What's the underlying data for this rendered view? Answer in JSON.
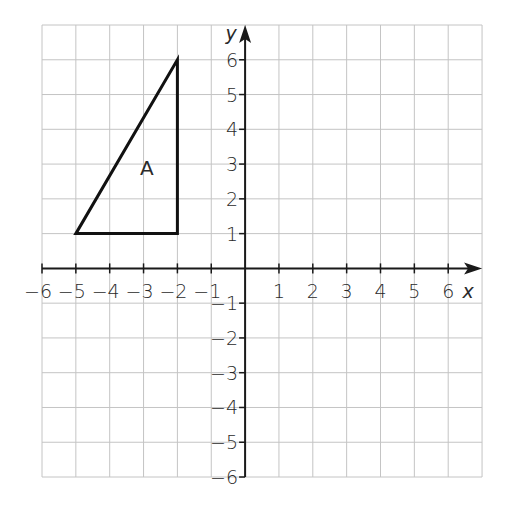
{
  "diagram": {
    "type": "coordinate-grid",
    "x_axis": {
      "label": "x",
      "min": -6,
      "max": 7,
      "tick_labels": [
        "-6",
        "-5",
        "-4",
        "-3",
        "-2",
        "-1",
        "1",
        "2",
        "3",
        "4",
        "5",
        "6"
      ]
    },
    "y_axis": {
      "label": "y",
      "min": -6,
      "max": 7,
      "tick_labels": [
        "6",
        "5",
        "4",
        "3",
        "2",
        "1",
        "-1",
        "-2",
        "-3",
        "-4",
        "-5",
        "-6"
      ]
    },
    "shapes": [
      {
        "name": "A",
        "label": "A",
        "type": "triangle",
        "vertices": [
          [
            -5,
            1
          ],
          [
            -2,
            1
          ],
          [
            -2,
            6
          ]
        ],
        "label_at": [
          -2.9,
          2.7
        ]
      }
    ],
    "colors": {
      "grid": "#c4c4c4",
      "axis": "#1a1a1a",
      "shape": "#111111"
    }
  }
}
